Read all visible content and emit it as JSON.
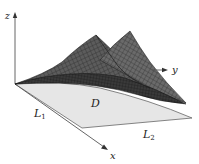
{
  "figure": {
    "axes": {
      "x_label": "x",
      "y_label": "y",
      "z_label": "z"
    },
    "region": {
      "label": "D",
      "fill_color": "#e6e6e6",
      "edge_color": "#555555"
    },
    "boundary_lines": {
      "L1": {
        "letter": "L",
        "subscript": "1"
      },
      "L2": {
        "letter": "L",
        "subscript": "2"
      }
    },
    "surface": {
      "dark_color": "#2b2b2b",
      "mid_color": "#5a5a5a",
      "light_color": "#8a8a8a",
      "mesh_color": "#1a1a1a"
    }
  }
}
